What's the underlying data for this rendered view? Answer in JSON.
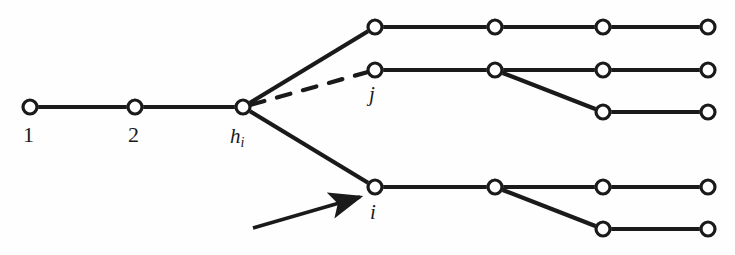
{
  "figure": {
    "background_color": "#fefefe",
    "stroke_color": "#1a1a1a",
    "node_fill": "#ffffff",
    "node_radius": 7,
    "node_stroke_width": 3.2,
    "edge_stroke_width": 4.2,
    "width": 735,
    "height": 255
  },
  "labels": {
    "node_1": "1",
    "node_2": "2",
    "node_h": "h",
    "node_h_sub": "i",
    "node_j": "j",
    "node_i": "i"
  },
  "nodes": [
    {
      "id": "n1",
      "name": "node-1",
      "x": 30,
      "y": 107,
      "label": "1"
    },
    {
      "id": "n2",
      "name": "node-2",
      "x": 135,
      "y": 107,
      "label": "2"
    },
    {
      "id": "nh",
      "name": "node-h-i",
      "x": 243,
      "y": 107,
      "label": "h_i"
    },
    {
      "id": "t1",
      "name": "node-top-row-1",
      "x": 375,
      "y": 27,
      "label": ""
    },
    {
      "id": "t2",
      "name": "node-top-row-2",
      "x": 495,
      "y": 27,
      "label": ""
    },
    {
      "id": "t3",
      "name": "node-top-row-3",
      "x": 603,
      "y": 27,
      "label": ""
    },
    {
      "id": "t4",
      "name": "node-top-row-4",
      "x": 708,
      "y": 27,
      "label": ""
    },
    {
      "id": "j1",
      "name": "node-j",
      "x": 375,
      "y": 70,
      "label": "j"
    },
    {
      "id": "j2",
      "name": "node-mid-row-2",
      "x": 495,
      "y": 70,
      "label": ""
    },
    {
      "id": "j3",
      "name": "node-mid-row-3",
      "x": 603,
      "y": 70,
      "label": ""
    },
    {
      "id": "j4",
      "name": "node-mid-row-4",
      "x": 708,
      "y": 70,
      "label": ""
    },
    {
      "id": "j3b",
      "name": "node-mid-branch-1",
      "x": 603,
      "y": 112,
      "label": ""
    },
    {
      "id": "j4b",
      "name": "node-mid-branch-2",
      "x": 708,
      "y": 112,
      "label": ""
    },
    {
      "id": "i1",
      "name": "node-i",
      "x": 375,
      "y": 187,
      "label": "i"
    },
    {
      "id": "i2",
      "name": "node-bot-row-2",
      "x": 495,
      "y": 187,
      "label": ""
    },
    {
      "id": "i3",
      "name": "node-bot-row-3",
      "x": 603,
      "y": 187,
      "label": ""
    },
    {
      "id": "i4",
      "name": "node-bot-row-4",
      "x": 708,
      "y": 187,
      "label": ""
    },
    {
      "id": "i3b",
      "name": "node-bot-branch-1",
      "x": 603,
      "y": 229,
      "label": ""
    },
    {
      "id": "i4b",
      "name": "node-bot-branch-2",
      "x": 708,
      "y": 229,
      "label": ""
    }
  ],
  "edges": [
    {
      "name": "edge-1-to-2",
      "from": "n1",
      "to": "n2",
      "style": "solid"
    },
    {
      "name": "edge-2-to-h",
      "from": "n2",
      "to": "nh",
      "style": "solid"
    },
    {
      "name": "edge-h-to-top",
      "from": "nh",
      "to": "t1",
      "style": "solid"
    },
    {
      "name": "edge-h-to-j",
      "from": "nh",
      "to": "j1",
      "style": "dashed"
    },
    {
      "name": "edge-h-to-i",
      "from": "nh",
      "to": "i1",
      "style": "solid"
    },
    {
      "name": "edge-top-1-2",
      "from": "t1",
      "to": "t2",
      "style": "solid"
    },
    {
      "name": "edge-top-2-3",
      "from": "t2",
      "to": "t3",
      "style": "solid"
    },
    {
      "name": "edge-top-3-4",
      "from": "t3",
      "to": "t4",
      "style": "solid"
    },
    {
      "name": "edge-mid-1-2",
      "from": "j1",
      "to": "j2",
      "style": "solid"
    },
    {
      "name": "edge-mid-2-3",
      "from": "j2",
      "to": "j3",
      "style": "solid"
    },
    {
      "name": "edge-mid-3-4",
      "from": "j3",
      "to": "j4",
      "style": "solid"
    },
    {
      "name": "edge-mid-2-branch",
      "from": "j2",
      "to": "j3b",
      "style": "solid"
    },
    {
      "name": "edge-mid-branch-1-2",
      "from": "j3b",
      "to": "j4b",
      "style": "solid"
    },
    {
      "name": "edge-bot-1-2",
      "from": "i1",
      "to": "i2",
      "style": "solid"
    },
    {
      "name": "edge-bot-2-3",
      "from": "i2",
      "to": "i3",
      "style": "solid"
    },
    {
      "name": "edge-bot-3-4",
      "from": "i3",
      "to": "i4",
      "style": "solid"
    },
    {
      "name": "edge-bot-2-branch",
      "from": "i2",
      "to": "i3b",
      "style": "solid"
    },
    {
      "name": "edge-bot-branch-1-2",
      "from": "i3b",
      "to": "i4b",
      "style": "solid"
    }
  ],
  "annotation_arrow": {
    "name": "pointer-arrow-to-node-i",
    "tail_x": 253,
    "tail_y": 228,
    "head_x": 360,
    "head_y": 197
  },
  "label_positions": {
    "node_1": {
      "x": 23,
      "y": 124
    },
    "node_2": {
      "x": 128,
      "y": 124
    },
    "node_h": {
      "x": 230,
      "y": 126
    },
    "node_j": {
      "x": 369,
      "y": 84
    },
    "node_i": {
      "x": 370,
      "y": 202
    }
  }
}
